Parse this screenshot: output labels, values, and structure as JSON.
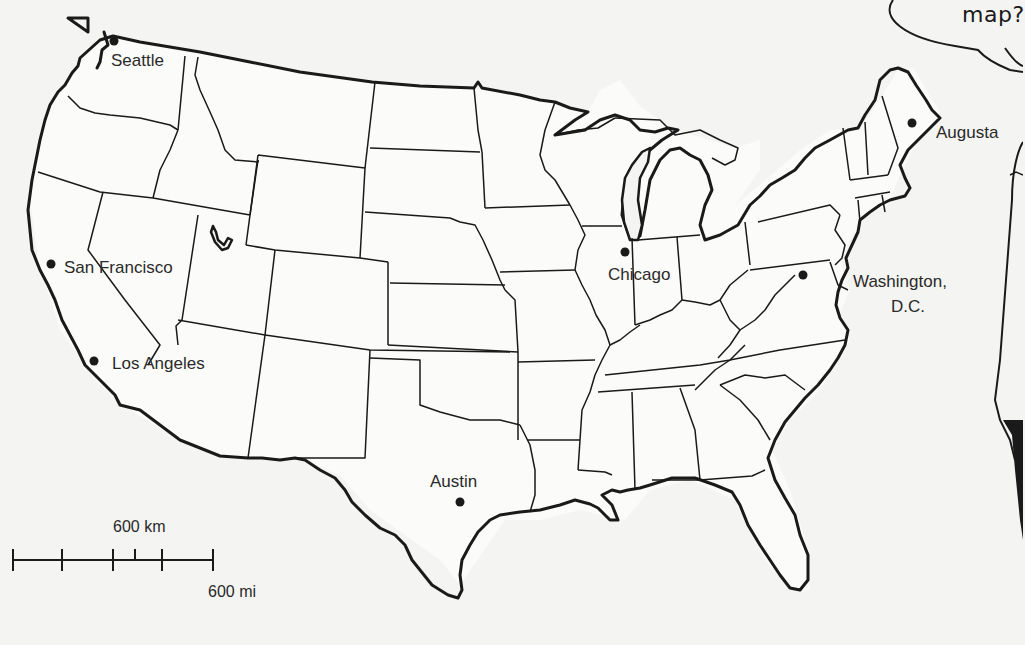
{
  "map": {
    "title": "United States outline map",
    "cities": [
      {
        "name": "Seattle",
        "dot": [
          114,
          41
        ],
        "label_pos": [
          111,
          52
        ]
      },
      {
        "name": "San Francisco",
        "dot": [
          51,
          264
        ],
        "label_pos": [
          64,
          259
        ]
      },
      {
        "name": "Los Angeles",
        "dot": [
          94,
          361
        ],
        "label_pos": [
          112,
          355
        ]
      },
      {
        "name": "Austin",
        "dot": [
          460,
          502
        ],
        "label_pos": [
          430,
          473
        ]
      },
      {
        "name": "Chicago",
        "dot": [
          625,
          252
        ],
        "label_pos": [
          608,
          266
        ]
      },
      {
        "name": "Washington, D.C.",
        "line1": "Washington,",
        "line2": "D.C.",
        "dot": [
          803,
          275
        ],
        "label_pos": [
          853,
          273
        ]
      },
      {
        "name": "Augusta",
        "dot": [
          912,
          123
        ],
        "label_pos": [
          936,
          124
        ]
      }
    ],
    "scale_bar": {
      "km_label": "600 km",
      "mi_label": "600 mi"
    }
  },
  "cartoon": {
    "speech_bubble_text": "map?"
  },
  "colors": {
    "background": "#f4f4f2",
    "ink": "#1a1a1a",
    "text": "#2a2a2a"
  }
}
